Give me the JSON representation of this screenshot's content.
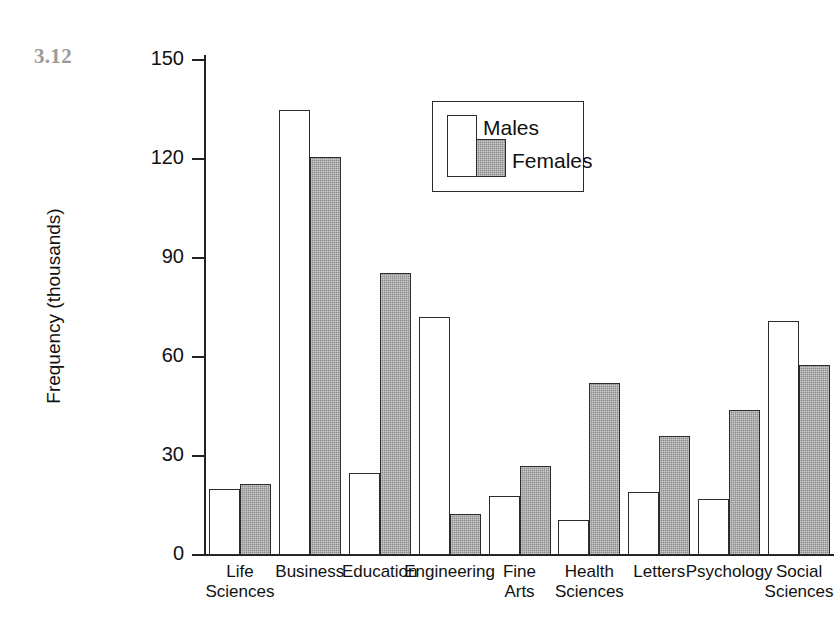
{
  "figure": {
    "number_label": "3.12",
    "number_color": "#9a9a9a"
  },
  "legend": {
    "position": "inside-top-center",
    "entries": [
      {
        "label": "Males",
        "color": "#ffffff",
        "style": "open-outline"
      },
      {
        "label": "Females",
        "color": "#8d8d8d",
        "style": "grey-filled"
      }
    ]
  },
  "chart_data": {
    "type": "bar",
    "title": "",
    "subtitle": "",
    "xlabel": "",
    "ylabel": "Frequency (thousands)",
    "ylim": [
      0,
      150
    ],
    "yticks": [
      0,
      30,
      60,
      90,
      120,
      150
    ],
    "ytick_labels": [
      "0",
      "30",
      "60",
      "90",
      "120",
      "150"
    ],
    "grid": false,
    "legend_entries": [
      "Males",
      "Females"
    ],
    "categories": [
      "Life Sciences",
      "Business",
      "Education",
      "Engineering",
      "Fine Arts",
      "Health Sciences",
      "Letters",
      "Psychology",
      "Social Sciences"
    ],
    "category_lines": [
      [
        "Life",
        "Sciences"
      ],
      [
        "Business",
        ""
      ],
      [
        "Education",
        ""
      ],
      [
        "Engineering",
        ""
      ],
      [
        "Fine",
        "Arts"
      ],
      [
        "Health",
        "Sciences"
      ],
      [
        "Letters",
        ""
      ],
      [
        "Psychology",
        ""
      ],
      [
        "Social",
        "Sciences"
      ]
    ],
    "series": [
      {
        "name": "Males",
        "color": "#ffffff",
        "values": [
          20,
          135,
          25,
          72,
          18,
          10.5,
          19,
          17,
          71
        ]
      },
      {
        "name": "Females",
        "color": "#8d8d8d",
        "values": [
          21.5,
          120.5,
          85.5,
          12.5,
          27,
          52,
          36,
          44,
          57.5
        ]
      }
    ]
  }
}
